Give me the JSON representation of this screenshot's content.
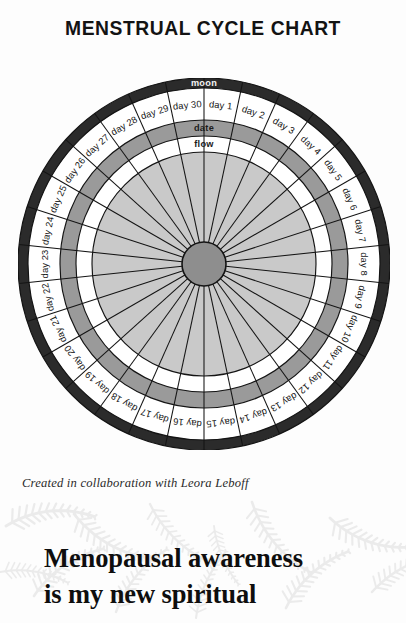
{
  "page": {
    "title": "MENSTRUAL CYCLE CHART",
    "background_color": "#fdfdfd"
  },
  "chart_data": {
    "type": "pie",
    "title": "MENSTRUAL CYCLE CHART",
    "subtitle": "",
    "xlabel": "",
    "ylabel": "",
    "segments": 30,
    "segment_angle_degrees": 12,
    "start_angle_degrees": 0,
    "direction": "clockwise",
    "categories": [
      "day 1",
      "day 2",
      "day 3",
      "day 4",
      "day 5",
      "day 6",
      "day 7",
      "day 8",
      "day 9",
      "day 10",
      "day 11",
      "day 12",
      "day 13",
      "day 14",
      "day 15",
      "day 16",
      "day 17",
      "day 18",
      "day 19",
      "day 20",
      "day 21",
      "day 22",
      "day 23",
      "day 24",
      "day 25",
      "day 26",
      "day 27",
      "day 28",
      "day 29",
      "day 30"
    ],
    "values": [
      1,
      1,
      1,
      1,
      1,
      1,
      1,
      1,
      1,
      1,
      1,
      1,
      1,
      1,
      1,
      1,
      1,
      1,
      1,
      1,
      1,
      1,
      1,
      1,
      1,
      1,
      1,
      1,
      1,
      1
    ],
    "rings": [
      {
        "name": "moon",
        "label": "moon",
        "order": 1,
        "outer_radius": 186,
        "inner_radius": 176,
        "fill": "#2b2b2b",
        "label_color": "#f4f4f4",
        "filled": false
      },
      {
        "name": "day",
        "label": "",
        "order": 2,
        "outer_radius": 176,
        "inner_radius": 144,
        "fill": "#ffffff",
        "label_color": "#161616",
        "filled": true
      },
      {
        "name": "date",
        "label": "date",
        "order": 3,
        "outer_radius": 144,
        "inner_radius": 128,
        "fill": "#9a9a9a",
        "label_color": "#1b1b1b",
        "filled": false
      },
      {
        "name": "flow",
        "label": "flow",
        "order": 4,
        "outer_radius": 128,
        "inner_radius": 112,
        "fill": "#ffffff",
        "label_color": "#1b1b1b",
        "filled": false
      },
      {
        "name": "notes",
        "label": "",
        "order": 5,
        "outer_radius": 112,
        "inner_radius": 22,
        "fill": "#c9c9c9",
        "label_color": "#1b1b1b",
        "filled": false
      }
    ],
    "hub": {
      "radius": 22,
      "fill": "#8e8e8e",
      "stroke": "#141414"
    },
    "legend_position": "none",
    "grid": true
  },
  "credit": {
    "text": "Created in collaboration with Leora Leboff"
  },
  "quote": {
    "line1": "Menopausal awareness",
    "line2": "is my new spiritual"
  },
  "colors": {
    "moon_band": "#2b2b2b",
    "date_band": "#9a9a9a",
    "inner_disc": "#c9c9c9",
    "hub": "#8e8e8e",
    "ink": "#131313",
    "watermark": "#b9b9b9"
  }
}
